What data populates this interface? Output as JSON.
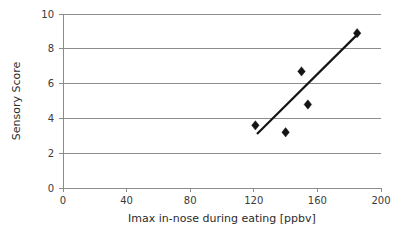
{
  "chart_data": {
    "type": "scatter",
    "title": "",
    "subtitle": "",
    "xlabel": "Imax in-nose during eating [ppbv]",
    "ylabel": "Sensory Score",
    "xlim": [
      0,
      200
    ],
    "ylim": [
      0,
      10
    ],
    "xticks": [
      0,
      40,
      80,
      120,
      160,
      200
    ],
    "yticks": [
      0,
      2,
      4,
      6,
      8,
      10
    ],
    "xtick_labels": [
      "0",
      "40",
      "80",
      "120",
      "160",
      "200"
    ],
    "ytick_labels": [
      "0",
      "2",
      "4",
      "6",
      "8",
      "10"
    ],
    "grid": "horizontal",
    "legend": "none",
    "marker": "diamond",
    "marker_color": "#141414",
    "series": [
      {
        "name": "Sensory Score vs Imax",
        "points": [
          {
            "x": 121,
            "y": 3.6
          },
          {
            "x": 140,
            "y": 3.2
          },
          {
            "x": 150,
            "y": 6.7
          },
          {
            "x": 154,
            "y": 4.8
          },
          {
            "x": 185,
            "y": 8.9
          }
        ]
      }
    ],
    "trendline": {
      "type": "linear",
      "color": "#141414",
      "x_start": 122,
      "y_start": 3.1,
      "x_end": 186,
      "y_end": 8.9
    },
    "colors": {
      "marker": "#141414",
      "trendline": "#141414",
      "gridline": "#8c8c8c",
      "axis": "#8c8c8c",
      "tick_text": "#3a3a3a",
      "axis_title": "#2b2b2b",
      "background": "#ffffff"
    }
  },
  "axes": {
    "y_title": "Sensory Score",
    "x_title": "Imax in-nose during eating [ppbv]",
    "y_labels": [
      "10",
      "8",
      "6",
      "4",
      "2",
      "0"
    ],
    "x_labels": [
      "0",
      "40",
      "80",
      "120",
      "160",
      "200"
    ]
  }
}
